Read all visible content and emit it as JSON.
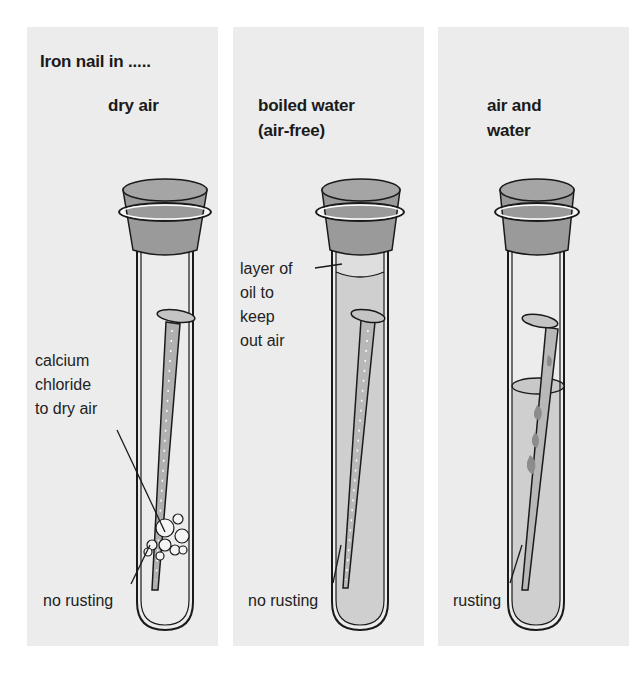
{
  "heading": "Iron nail in .....",
  "colors": {
    "panel_bg": "#ececec",
    "cork": "#9a9a9a",
    "water": "#cfcfcf",
    "oil": "#dedede",
    "nail": "#b0b0b0",
    "rust": "#8c8c8c",
    "outline": "#1a1a1a"
  },
  "panels": [
    {
      "condition": "dry air",
      "labels": [
        "calcium",
        "chloride",
        "to dry air"
      ],
      "result": "no rusting"
    },
    {
      "condition_line1": "boiled water",
      "condition_line2": "(air-free)",
      "labels": [
        "layer of",
        "oil to",
        "keep",
        "out air"
      ],
      "result": "no rusting"
    },
    {
      "condition_line1": "air and",
      "condition_line2": "water",
      "result": "rusting"
    }
  ]
}
